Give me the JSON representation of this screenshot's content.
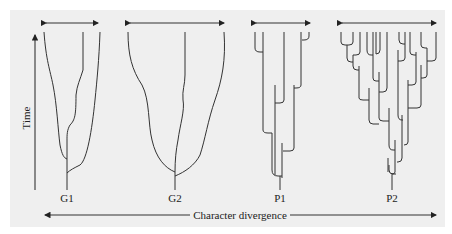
{
  "figure": {
    "background_color": "#efefef",
    "line_color": "#333333",
    "y_axis": {
      "label": "Time",
      "direction": "up"
    },
    "x_axis": {
      "label": "Character divergence",
      "direction": "both"
    },
    "trees": [
      {
        "id": "G1",
        "label": "G1",
        "pattern": "gradualism, 3 lineages",
        "spread_arrow": "both"
      },
      {
        "id": "G2",
        "label": "G2",
        "pattern": "gradualism, 3 lineages, wider divergence",
        "spread_arrow": "both"
      },
      {
        "id": "P1",
        "label": "P1",
        "pattern": "punctuated equilibrium, branching",
        "spread_arrow": "both"
      },
      {
        "id": "P2",
        "label": "P2",
        "pattern": "punctuated equilibrium, extensive branching",
        "spread_arrow": "both"
      }
    ]
  }
}
